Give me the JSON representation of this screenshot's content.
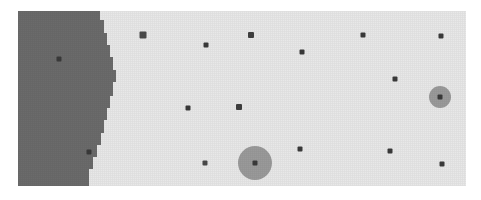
{
  "figure": {
    "name": "region-scatter-map",
    "type": "raster-region-map",
    "width": 481,
    "height": 200
  },
  "canvas": {
    "x": 18,
    "y": 11,
    "width": 448,
    "height": 175,
    "background_color": "#e8e8e8"
  },
  "regions": [
    {
      "name": "dark-region",
      "label": "",
      "fill_color": "#6b6b6b",
      "polygon": "18,11 100,11 100,20 104,20 104,33 107,33 107,45 110,45 110,57 113,57 113,70 116,70 116,82 113,82 113,96 110,96 110,108 107,108 107,120 104,120 104,133 101,133 101,145 97,145 97,157 93,157 93,169 89,169 89,186 18,186"
    }
  ],
  "halos": [
    {
      "name": "halo-large",
      "cx": 255,
      "cy": 163,
      "r": 17,
      "color": "#9a9a9a"
    },
    {
      "name": "halo-small",
      "cx": 440,
      "cy": 97,
      "r": 11,
      "color": "#9a9a9a"
    }
  ],
  "points": [
    {
      "name": "point-01",
      "x": 59,
      "y": 59,
      "size": 5,
      "color": "#3a3a3a",
      "in_region": "dark-region"
    },
    {
      "name": "point-02",
      "x": 89,
      "y": 152,
      "size": 5,
      "color": "#3a3a3a",
      "in_region": "dark-region"
    },
    {
      "name": "point-03",
      "x": 143,
      "y": 35,
      "size": 7,
      "color": "#4a4a4a",
      "in_region": "light"
    },
    {
      "name": "point-04",
      "x": 206,
      "y": 45,
      "size": 5,
      "color": "#3a3a3a",
      "in_region": "light"
    },
    {
      "name": "point-05",
      "x": 251,
      "y": 35,
      "size": 6,
      "color": "#3f3f3f",
      "in_region": "light"
    },
    {
      "name": "point-06",
      "x": 302,
      "y": 52,
      "size": 5,
      "color": "#3a3a3a",
      "in_region": "light"
    },
    {
      "name": "point-07",
      "x": 363,
      "y": 35,
      "size": 5,
      "color": "#3a3a3a",
      "in_region": "light"
    },
    {
      "name": "point-08",
      "x": 441,
      "y": 36,
      "size": 5,
      "color": "#3a3a3a",
      "in_region": "light"
    },
    {
      "name": "point-09",
      "x": 395,
      "y": 79,
      "size": 5,
      "color": "#3a3a3a",
      "in_region": "light"
    },
    {
      "name": "point-10",
      "x": 188,
      "y": 108,
      "size": 5,
      "color": "#3a3a3a",
      "in_region": "light"
    },
    {
      "name": "point-11",
      "x": 239,
      "y": 107,
      "size": 6,
      "color": "#3f3f3f",
      "in_region": "light"
    },
    {
      "name": "point-12",
      "x": 440,
      "y": 97,
      "size": 5,
      "color": "#3a3a3a",
      "in_region": "light"
    },
    {
      "name": "point-13",
      "x": 205,
      "y": 163,
      "size": 5,
      "color": "#4a4a4a",
      "in_region": "light"
    },
    {
      "name": "point-14",
      "x": 255,
      "y": 163,
      "size": 5,
      "color": "#3a3a3a",
      "in_region": "light"
    },
    {
      "name": "point-15",
      "x": 300,
      "y": 149,
      "size": 5,
      "color": "#3a3a3a",
      "in_region": "light"
    },
    {
      "name": "point-16",
      "x": 390,
      "y": 151,
      "size": 5,
      "color": "#3a3a3a",
      "in_region": "light"
    },
    {
      "name": "point-17",
      "x": 442,
      "y": 164,
      "size": 5,
      "color": "#3a3a3a",
      "in_region": "light"
    }
  ],
  "colors": {
    "page_background": "#ffffff",
    "canvas_background": "#e8e8e8",
    "region_dark": "#6b6b6b",
    "halo": "#9a9a9a",
    "marker": "#3a3a3a"
  }
}
